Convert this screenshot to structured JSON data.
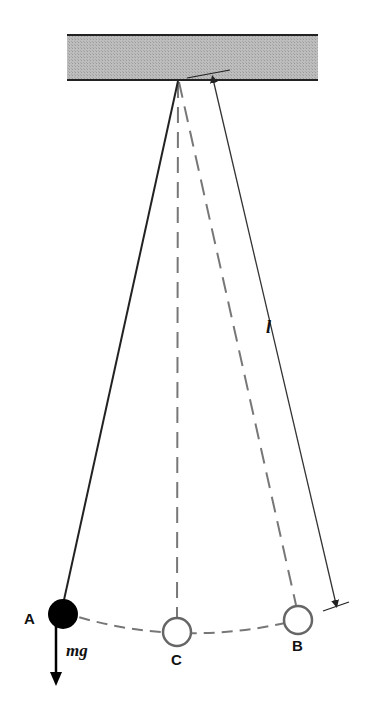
{
  "diagram": {
    "colors": {
      "ceiling_fill": "#b8b8b8",
      "line": "#222222",
      "dashed": "#666666",
      "bob_filled": "#000000",
      "bob_hollow_stroke": "#666666"
    },
    "labels": {
      "point_a": "A",
      "point_b": "B",
      "point_c": "C",
      "length": "l",
      "force": "mg"
    }
  }
}
